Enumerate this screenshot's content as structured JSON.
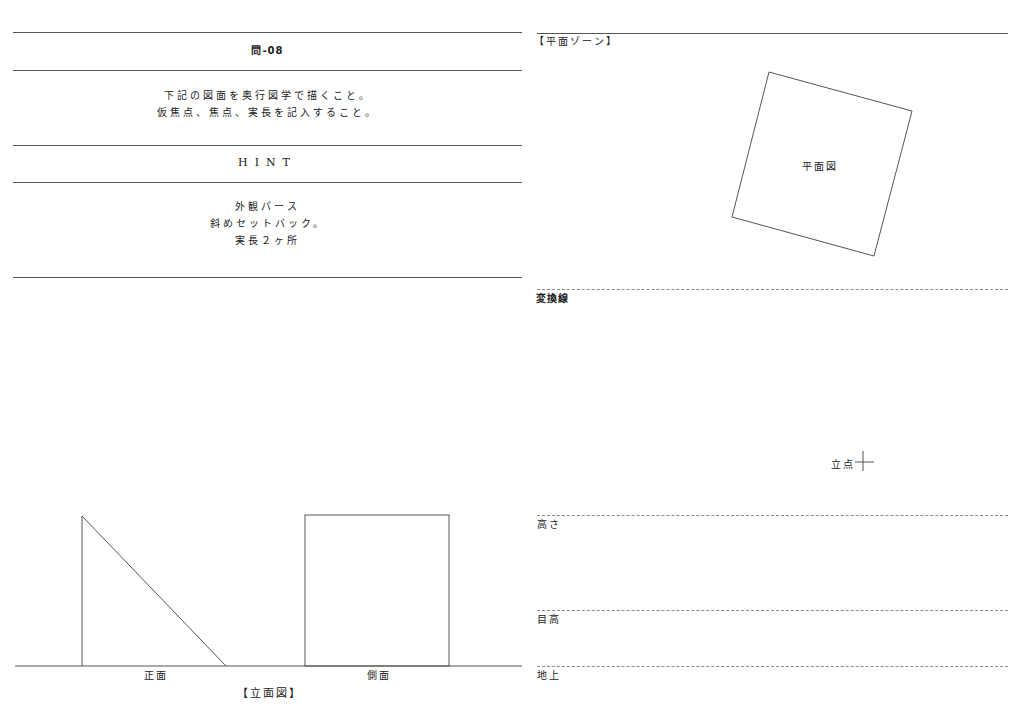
{
  "problem": {
    "title": "問-08",
    "instructions": [
      "下記の図面を奥行図学で描くこと。",
      "仮焦点、焦点、実長を記入すること。"
    ],
    "hint_heading": "HINT",
    "hint_lines": [
      "外観パース",
      "斜めセットバック。",
      "実長２ヶ所"
    ]
  },
  "plan_zone": {
    "heading": "【平面ゾーン】",
    "plan_label": "平面図",
    "plan_polygon": [
      [
        769,
        72
      ],
      [
        912,
        111
      ],
      [
        874,
        256
      ],
      [
        732,
        217
      ]
    ]
  },
  "projection": {
    "conversion_line_label": "変換線",
    "standing_point_label": "立点",
    "standing_point": [
      863,
      462
    ]
  },
  "levels": {
    "height_label": "高さ",
    "eye_level_label": "目高",
    "ground_label": "地上"
  },
  "elevation": {
    "front_label": "正面",
    "side_label": "側面",
    "caption": "【立面図】"
  }
}
